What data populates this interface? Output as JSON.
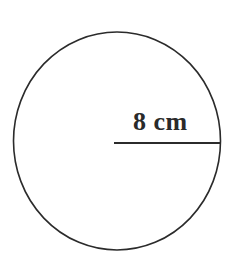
{
  "figure": {
    "kind": "geometry-diagram",
    "background_color": "#ffffff",
    "stroke_color": "#2b2b2b",
    "text_color": "#2a2a2a",
    "canvas": {
      "width": 237,
      "height": 264
    }
  },
  "circle": {
    "center_x": 117,
    "center_y": 141,
    "radius_x": 103.5,
    "radius_y": 109,
    "stroke_width": 1.6,
    "fill": "none"
  },
  "radius_line": {
    "x1": 114,
    "y1": 143,
    "x2": 221,
    "y2": 143,
    "stroke_width": 2
  },
  "labels": {
    "radius_measure": "8 cm"
  },
  "chart_data": {
    "type": "diagram",
    "title": "",
    "shape": "circle",
    "measurements": [
      {
        "name": "radius",
        "value": 8,
        "unit": "cm",
        "label": "8 cm"
      }
    ],
    "annotations": [
      "8 cm"
    ]
  }
}
